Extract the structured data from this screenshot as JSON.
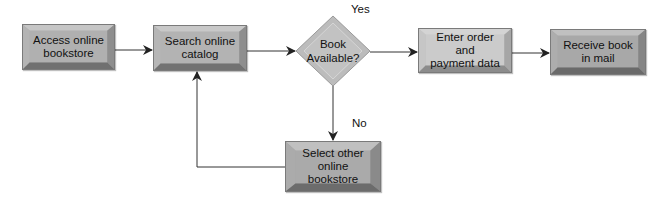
{
  "diagram": {
    "type": "flowchart",
    "nodes": [
      {
        "id": "access",
        "shape": "process",
        "label": "Access online\nbookstore"
      },
      {
        "id": "search",
        "shape": "process",
        "label": "Search online\ncatalog"
      },
      {
        "id": "decision",
        "shape": "decision",
        "label": "Book\nAvailable?"
      },
      {
        "id": "order",
        "shape": "process",
        "label": "Enter order and\npayment data"
      },
      {
        "id": "receive",
        "shape": "process",
        "label": "Receive book\nin mail"
      },
      {
        "id": "select",
        "shape": "process",
        "label": "Select other\nonline\nbookstore"
      }
    ],
    "edges": [
      {
        "from": "access",
        "to": "search",
        "label": ""
      },
      {
        "from": "search",
        "to": "decision",
        "label": ""
      },
      {
        "from": "decision",
        "to": "order",
        "label": "Yes"
      },
      {
        "from": "order",
        "to": "receive",
        "label": ""
      },
      {
        "from": "decision",
        "to": "select",
        "label": "No"
      },
      {
        "from": "select",
        "to": "search",
        "label": ""
      }
    ],
    "labels": {
      "yes": "Yes",
      "no": "No"
    }
  },
  "colors": {
    "face_dark": "#a8a8a8",
    "face_light": "#c4c4c4",
    "bevel_top": "#c8c8c8",
    "bevel_bottom": "#6e6e6e",
    "diamond": "#bdbdbd",
    "line": "#333333"
  }
}
